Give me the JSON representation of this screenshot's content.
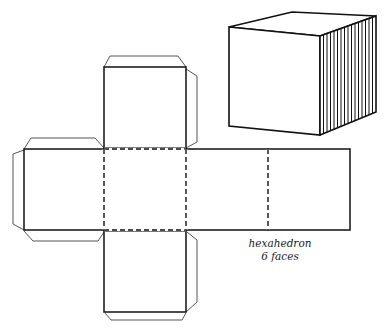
{
  "diagram": {
    "title": "hexahedron",
    "subtitle": "6 faces",
    "colors": {
      "line": "#111111",
      "tab": "#555555",
      "background": "#ffffff"
    },
    "cube": {
      "front": [
        [
          229,
          27
        ],
        [
          320,
          36
        ],
        [
          320,
          135
        ],
        [
          229,
          126
        ]
      ],
      "top": [
        [
          229,
          27
        ],
        [
          292,
          12
        ],
        [
          376,
          16
        ],
        [
          320,
          36
        ]
      ],
      "side": [
        [
          320,
          36
        ],
        [
          376,
          16
        ],
        [
          376,
          112
        ],
        [
          320,
          135
        ]
      ],
      "side_hatch_lines": 16
    },
    "net": {
      "faces": [
        {
          "name": "top",
          "x": 104,
          "y": 67,
          "w": 82,
          "h": 81
        },
        {
          "name": "left",
          "x": 24,
          "y": 149,
          "w": 80,
          "h": 81
        },
        {
          "name": "center",
          "x": 104,
          "y": 149,
          "w": 82,
          "h": 81
        },
        {
          "name": "right",
          "x": 186,
          "y": 149,
          "w": 82,
          "h": 81
        },
        {
          "name": "far-right",
          "x": 268,
          "y": 149,
          "w": 82,
          "h": 81
        },
        {
          "name": "bottom",
          "x": 104,
          "y": 231,
          "w": 82,
          "h": 81
        }
      ],
      "tabs": [
        [
          [
            104,
            67
          ],
          [
            110,
            56
          ],
          [
            178,
            56
          ],
          [
            186,
            67
          ]
        ],
        [
          [
            186,
            69
          ],
          [
            197,
            76
          ],
          [
            197,
            142
          ],
          [
            186,
            148
          ]
        ],
        [
          [
            24,
            149
          ],
          [
            31,
            138
          ],
          [
            95,
            138
          ],
          [
            104,
            148
          ]
        ],
        [
          [
            24,
            150
          ],
          [
            13,
            154
          ],
          [
            13,
            224
          ],
          [
            24,
            230
          ]
        ],
        [
          [
            24,
            231
          ],
          [
            33,
            241
          ],
          [
            98,
            241
          ],
          [
            104,
            232
          ]
        ],
        [
          [
            187,
            232
          ],
          [
            197,
            240
          ],
          [
            197,
            302
          ],
          [
            186,
            312
          ]
        ],
        [
          [
            105,
            313
          ],
          [
            111,
            320
          ],
          [
            182,
            320
          ],
          [
            186,
            313
          ]
        ]
      ],
      "fold_lines": [
        [
          [
            104,
            149
          ],
          [
            186,
            149
          ]
        ],
        [
          [
            104,
            230
          ],
          [
            186,
            230
          ]
        ],
        [
          [
            104,
            149
          ],
          [
            104,
            230
          ]
        ],
        [
          [
            186,
            149
          ],
          [
            186,
            230
          ]
        ],
        [
          [
            268,
            149
          ],
          [
            268,
            230
          ]
        ]
      ]
    }
  }
}
